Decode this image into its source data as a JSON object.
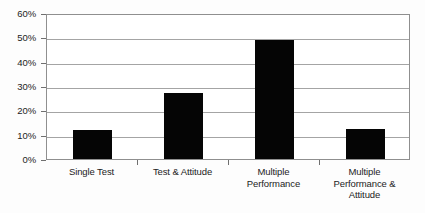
{
  "chart_data": {
    "type": "bar",
    "title": "",
    "subtitle": "",
    "xlabel": "",
    "ylabel": "",
    "categories": [
      "Single Test",
      "Test & Attitude",
      "Multiple Performance",
      "Multiple Performance & Attitude"
    ],
    "category_lines": [
      [
        "Single Test"
      ],
      [
        "Test & Attitude"
      ],
      [
        "Multiple",
        "Performance"
      ],
      [
        "Multiple",
        "Performance &",
        "Attitude"
      ]
    ],
    "values": [
      12,
      27,
      48.8,
      12.5
    ],
    "value_labels": [
      "12%",
      "27%",
      "49%",
      "13%"
    ],
    "ylim": [
      0,
      60
    ],
    "ytick_values": [
      0,
      10,
      20,
      30,
      40,
      50,
      60
    ],
    "ytick_labels": [
      "0%",
      "10%",
      "20%",
      "30%",
      "40%",
      "50%",
      "60%"
    ],
    "grid": true,
    "legend": false,
    "legend_position": "none",
    "bar_color": "#050505",
    "grid_color": "#a4a4a4",
    "axis_color": "#8f8f8f",
    "background_color": "#ffffff"
  }
}
